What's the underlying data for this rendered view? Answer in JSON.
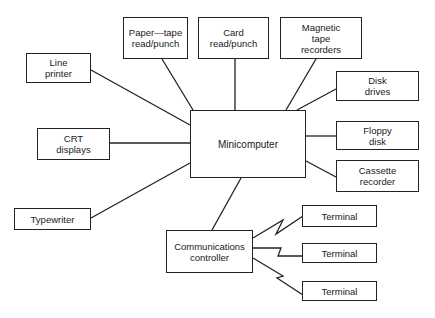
{
  "diagram": {
    "type": "block-diagram",
    "center": {
      "id": "minicomputer",
      "lines": [
        "Minicomputer"
      ]
    },
    "nodes": [
      {
        "id": "paper-tape",
        "lines": [
          "Paper—tape",
          "read/punch"
        ]
      },
      {
        "id": "card",
        "lines": [
          "Card",
          "read/punch"
        ]
      },
      {
        "id": "mag-tape",
        "lines": [
          "Magnetic",
          "tape",
          "recorders"
        ]
      },
      {
        "id": "line-printer",
        "lines": [
          "Line",
          "printer"
        ]
      },
      {
        "id": "crt",
        "lines": [
          "CRT",
          "displays"
        ]
      },
      {
        "id": "typewriter",
        "lines": [
          "Typewriter"
        ]
      },
      {
        "id": "disk-drives",
        "lines": [
          "Disk",
          "drives"
        ]
      },
      {
        "id": "floppy",
        "lines": [
          "Floppy",
          "disk"
        ]
      },
      {
        "id": "cassette",
        "lines": [
          "Cassette",
          "recorder"
        ]
      },
      {
        "id": "comms",
        "lines": [
          "Communications",
          "controller"
        ]
      },
      {
        "id": "terminal-1",
        "lines": [
          "Terminal"
        ]
      },
      {
        "id": "terminal-2",
        "lines": [
          "Terminal"
        ]
      },
      {
        "id": "terminal-3",
        "lines": [
          "Terminal"
        ]
      }
    ],
    "edges": [
      {
        "from": "paper-tape",
        "to": "minicomputer",
        "style": "straight"
      },
      {
        "from": "card",
        "to": "minicomputer",
        "style": "straight"
      },
      {
        "from": "mag-tape",
        "to": "minicomputer",
        "style": "straight"
      },
      {
        "from": "disk-drives",
        "to": "minicomputer",
        "style": "straight"
      },
      {
        "from": "line-printer",
        "to": "minicomputer",
        "style": "straight"
      },
      {
        "from": "crt",
        "to": "minicomputer",
        "style": "straight"
      },
      {
        "from": "typewriter",
        "to": "minicomputer",
        "style": "straight"
      },
      {
        "from": "floppy",
        "to": "minicomputer",
        "style": "straight"
      },
      {
        "from": "cassette",
        "to": "minicomputer",
        "style": "straight"
      },
      {
        "from": "comms",
        "to": "minicomputer",
        "style": "straight"
      },
      {
        "from": "comms",
        "to": "terminal-1",
        "style": "zigzag"
      },
      {
        "from": "comms",
        "to": "terminal-2",
        "style": "zigzag"
      },
      {
        "from": "comms",
        "to": "terminal-3",
        "style": "zigzag"
      }
    ]
  },
  "colors": {
    "line": "#222222",
    "background": "#ffffff",
    "text": "#1a1a1a"
  }
}
